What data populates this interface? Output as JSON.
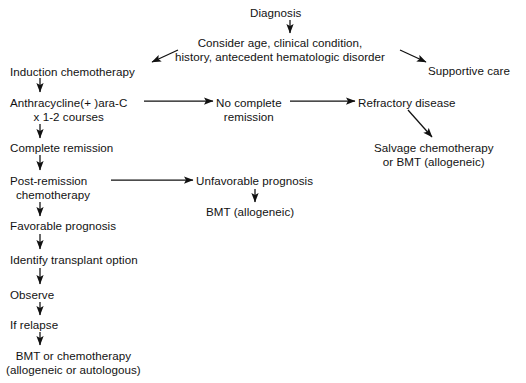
{
  "diagram": {
    "type": "flowchart",
    "background": "#ffffff",
    "stroke": "#111111",
    "nodes": [
      {
        "id": "diagnosis",
        "label": "Diagnosis",
        "x": 250,
        "y": 6,
        "align": "center"
      },
      {
        "id": "consider",
        "line1": "Consider age, clinical condition,",
        "line2": "history, antecedent hematologic disorder",
        "x": 175,
        "y": 36,
        "align": "center"
      },
      {
        "id": "induction",
        "label": "Induction chemotherapy",
        "x": 10,
        "y": 65,
        "align": "left"
      },
      {
        "id": "supportive",
        "label": "Supportive care",
        "x": 428,
        "y": 64,
        "align": "left"
      },
      {
        "id": "anthracycline",
        "line1": "Anthracycline(+ )ara-C",
        "line2": "x 1-2 courses",
        "x": 10,
        "y": 96,
        "align": "left"
      },
      {
        "id": "nocomplete",
        "line1": "No complete",
        "line2": "remission",
        "x": 216,
        "y": 96,
        "align": "left"
      },
      {
        "id": "refractory",
        "label": "Refractory disease",
        "x": 358,
        "y": 96,
        "align": "left"
      },
      {
        "id": "salvage",
        "line1": "Salvage chemotherapy",
        "line2": "or BMT (allogeneic)",
        "x": 374,
        "y": 141,
        "align": "center"
      },
      {
        "id": "completerem",
        "label": "Complete remission",
        "x": 10,
        "y": 141,
        "align": "left"
      },
      {
        "id": "postremission",
        "line1": "Post-remission",
        "line2": "chemotherapy",
        "x": 10,
        "y": 174,
        "align": "left"
      },
      {
        "id": "unfavorable",
        "label": "Unfavorable prognosis",
        "x": 196,
        "y": 174,
        "align": "left"
      },
      {
        "id": "bmtallo",
        "label": "BMT (allogeneic)",
        "x": 206,
        "y": 205,
        "align": "left"
      },
      {
        "id": "favorable",
        "label": "Favorable prognosis",
        "x": 10,
        "y": 219,
        "align": "left"
      },
      {
        "id": "identify",
        "label": "Identify transplant option",
        "x": 10,
        "y": 253,
        "align": "left"
      },
      {
        "id": "observe",
        "label": "Observe",
        "x": 10,
        "y": 288,
        "align": "left"
      },
      {
        "id": "ifrelapse",
        "label": "If relapse",
        "x": 10,
        "y": 318,
        "align": "left"
      },
      {
        "id": "bmtchemo",
        "line1": "BMT or chemotherapy",
        "line2": "(allogeneic or autologous)",
        "x": 6,
        "y": 349,
        "align": "center"
      }
    ],
    "edges": [
      {
        "id": "diagnosis-to-consider",
        "from": "diagnosis",
        "to": "consider",
        "kind": "vertical-down"
      },
      {
        "id": "consider-to-induction",
        "from": "consider",
        "to": "induction",
        "kind": "diagonal-down-left"
      },
      {
        "id": "consider-to-supportive",
        "from": "consider",
        "to": "supportive",
        "kind": "diagonal-down-right"
      },
      {
        "id": "induction-to-anthracycline",
        "from": "induction",
        "to": "anthracycline",
        "kind": "vertical-down"
      },
      {
        "id": "anthracycline-to-nocomplete",
        "from": "anthracycline",
        "to": "nocomplete",
        "kind": "horizontal-right"
      },
      {
        "id": "nocomplete-to-refractory",
        "from": "nocomplete",
        "to": "refractory",
        "kind": "horizontal-right"
      },
      {
        "id": "refractory-to-salvage",
        "from": "refractory",
        "to": "salvage",
        "kind": "diagonal-down-right"
      },
      {
        "id": "anthracycline-to-completerem",
        "from": "anthracycline",
        "to": "completerem",
        "kind": "vertical-down"
      },
      {
        "id": "completerem-to-postremission",
        "from": "completerem",
        "to": "postremission",
        "kind": "vertical-down"
      },
      {
        "id": "postremission-to-unfavorable",
        "from": "postremission",
        "to": "unfavorable",
        "kind": "horizontal-right"
      },
      {
        "id": "unfavorable-to-bmtallo",
        "from": "unfavorable",
        "to": "bmtallo",
        "kind": "vertical-down"
      },
      {
        "id": "postremission-to-favorable",
        "from": "postremission",
        "to": "favorable",
        "kind": "vertical-down"
      },
      {
        "id": "favorable-to-identify",
        "from": "favorable",
        "to": "identify",
        "kind": "vertical-down"
      },
      {
        "id": "identify-to-observe",
        "from": "identify",
        "to": "observe",
        "kind": "vertical-down"
      },
      {
        "id": "observe-to-ifrelapse",
        "from": "observe",
        "to": "ifrelapse",
        "kind": "vertical-down"
      },
      {
        "id": "ifrelapse-to-bmtchemo",
        "from": "ifrelapse",
        "to": "bmtchemo",
        "kind": "vertical-down"
      }
    ]
  }
}
